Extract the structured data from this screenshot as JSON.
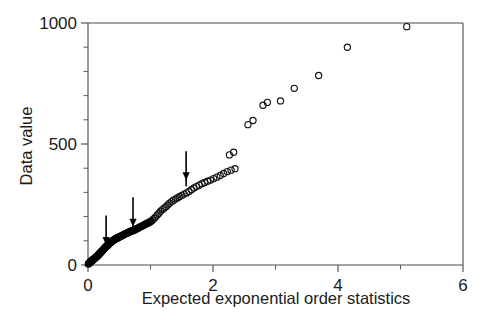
{
  "figure": {
    "background": "#ffffff",
    "ink_color": "#1a1a1a",
    "marker_color": "#111111"
  },
  "chart_data": {
    "type": "scatter",
    "title": "",
    "subtitle": "",
    "xlabel": "Expected exponential order statistics",
    "ylabel": "Data value",
    "xlim": [
      0,
      6
    ],
    "ylim": [
      0,
      1000
    ],
    "grid": false,
    "legend": null,
    "legend_position": "none",
    "x_ticks": [
      0,
      1,
      2,
      3,
      4,
      5,
      6
    ],
    "x_ticklabels": [
      "0",
      "",
      "2",
      "",
      "4",
      "",
      "6"
    ],
    "x_tick_labeled": [
      0,
      2,
      4,
      6
    ],
    "y_ticks": [
      0,
      100,
      200,
      300,
      400,
      500,
      600,
      700,
      800,
      900,
      1000
    ],
    "y_ticklabels": [
      "0",
      "",
      "",
      "",
      "",
      "500",
      "",
      "",
      "",
      "",
      "1000"
    ],
    "y_tick_labeled": [
      0,
      500,
      1000
    ],
    "marker": "open-circle",
    "marker_size": 4.0,
    "points": [
      [
        0.008,
        4
      ],
      [
        0.016,
        7
      ],
      [
        0.025,
        9
      ],
      [
        0.033,
        11
      ],
      [
        0.042,
        13
      ],
      [
        0.05,
        15
      ],
      [
        0.059,
        17
      ],
      [
        0.068,
        19
      ],
      [
        0.077,
        21
      ],
      [
        0.086,
        23
      ],
      [
        0.095,
        25
      ],
      [
        0.104,
        27
      ],
      [
        0.113,
        29
      ],
      [
        0.123,
        31
      ],
      [
        0.132,
        33
      ],
      [
        0.142,
        35
      ],
      [
        0.152,
        38
      ],
      [
        0.162,
        40
      ],
      [
        0.172,
        43
      ],
      [
        0.182,
        46
      ],
      [
        0.192,
        49
      ],
      [
        0.203,
        52
      ],
      [
        0.213,
        55
      ],
      [
        0.224,
        58
      ],
      [
        0.235,
        61
      ],
      [
        0.246,
        64
      ],
      [
        0.257,
        67
      ],
      [
        0.268,
        70
      ],
      [
        0.28,
        73
      ],
      [
        0.291,
        76
      ],
      [
        0.303,
        79
      ],
      [
        0.315,
        82
      ],
      [
        0.327,
        85
      ],
      [
        0.339,
        88
      ],
      [
        0.352,
        91
      ],
      [
        0.364,
        94
      ],
      [
        0.377,
        96
      ],
      [
        0.39,
        99
      ],
      [
        0.403,
        101
      ],
      [
        0.417,
        104
      ],
      [
        0.43,
        106
      ],
      [
        0.444,
        108
      ],
      [
        0.458,
        110
      ],
      [
        0.472,
        112
      ],
      [
        0.487,
        114
      ],
      [
        0.501,
        116
      ],
      [
        0.516,
        118
      ],
      [
        0.531,
        120
      ],
      [
        0.547,
        122
      ],
      [
        0.562,
        124
      ],
      [
        0.578,
        126
      ],
      [
        0.594,
        128
      ],
      [
        0.611,
        130
      ],
      [
        0.627,
        132
      ],
      [
        0.644,
        134
      ],
      [
        0.662,
        136
      ],
      [
        0.679,
        138
      ],
      [
        0.697,
        140
      ],
      [
        0.715,
        142
      ],
      [
        0.734,
        144
      ],
      [
        0.753,
        146
      ],
      [
        0.772,
        149
      ],
      [
        0.791,
        151
      ],
      [
        0.811,
        154
      ],
      [
        0.832,
        157
      ],
      [
        0.852,
        159
      ],
      [
        0.873,
        162
      ],
      [
        0.895,
        165
      ],
      [
        0.917,
        168
      ],
      [
        0.939,
        171
      ],
      [
        0.962,
        174
      ],
      [
        0.985,
        177
      ],
      [
        1.009,
        181
      ],
      [
        1.033,
        186
      ],
      [
        1.058,
        192
      ],
      [
        1.083,
        199
      ],
      [
        1.109,
        207
      ],
      [
        1.135,
        214
      ],
      [
        1.162,
        222
      ],
      [
        1.19,
        229
      ],
      [
        1.218,
        235
      ],
      [
        1.247,
        241
      ],
      [
        1.276,
        248
      ],
      [
        1.306,
        255
      ],
      [
        1.337,
        262
      ],
      [
        1.369,
        268
      ],
      [
        1.402,
        273
      ],
      [
        1.435,
        278
      ],
      [
        1.469,
        283
      ],
      [
        1.504,
        288
      ],
      [
        1.54,
        293
      ],
      [
        1.577,
        298
      ],
      [
        1.615,
        304
      ],
      [
        1.654,
        311
      ],
      [
        1.694,
        318
      ],
      [
        1.735,
        324
      ],
      [
        1.778,
        330
      ],
      [
        1.822,
        336
      ],
      [
        1.867,
        341
      ],
      [
        1.913,
        346
      ],
      [
        1.961,
        351
      ],
      [
        2.011,
        357
      ],
      [
        2.062,
        363
      ],
      [
        2.116,
        370
      ],
      [
        2.171,
        378
      ],
      [
        2.229,
        386
      ],
      [
        2.289,
        392
      ],
      [
        2.352,
        398
      ],
      [
        2.262,
        455
      ],
      [
        2.33,
        466
      ],
      [
        2.56,
        580
      ],
      [
        2.64,
        597
      ],
      [
        2.8,
        660
      ],
      [
        2.87,
        672
      ],
      [
        3.08,
        678
      ],
      [
        3.3,
        730
      ],
      [
        3.69,
        783
      ],
      [
        4.15,
        900
      ],
      [
        5.1,
        985
      ]
    ],
    "annotations": [
      {
        "type": "arrow",
        "direction": "down",
        "x": 0.29,
        "y_tip": 83,
        "y_tail": 205,
        "label": ""
      },
      {
        "type": "arrow",
        "direction": "down",
        "x": 0.72,
        "y_tip": 158,
        "y_tail": 280,
        "label": ""
      },
      {
        "type": "arrow",
        "direction": "down",
        "x": 1.57,
        "y_tip": 350,
        "y_tail": 470,
        "label": ""
      }
    ]
  }
}
